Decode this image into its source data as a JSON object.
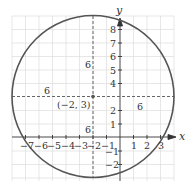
{
  "diagram": {
    "type": "circle-on-coordinate-plane",
    "center": {
      "x": -2,
      "y": 3,
      "label": "(−2, 3)"
    },
    "radius": 6,
    "radius_labels": [
      "6",
      "6",
      "6",
      "6"
    ],
    "axes": {
      "x_label": "x",
      "y_label": "y",
      "x_ticks": [
        "−7",
        "−6",
        "−5",
        "−4",
        "−3",
        "−2",
        "−1",
        "1",
        "2",
        "3"
      ],
      "y_ticks": [
        "8",
        "7",
        "6",
        "5",
        "4",
        "2",
        "1",
        "−1",
        "−2"
      ]
    },
    "colors": {
      "circle": "#555555",
      "grid": "#dddddd",
      "axis": "#333333",
      "dash": "#555555"
    }
  }
}
